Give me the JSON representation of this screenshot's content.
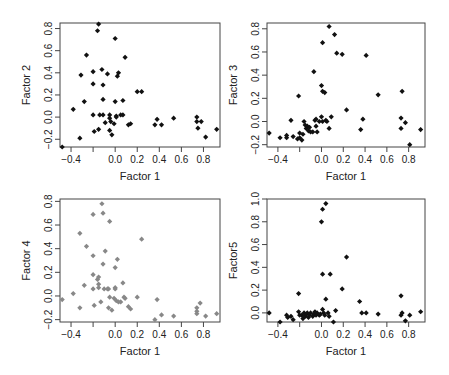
{
  "figure": {
    "layout": "2x2 scatter matrix",
    "point_colors": {
      "default": "#111111",
      "factor4": "#888888"
    }
  },
  "chart_data": [
    {
      "type": "scatter",
      "title": "",
      "xlabel": "Factor 1",
      "ylabel": "Factor 2",
      "xlim": [
        -0.5,
        0.95
      ],
      "ylim": [
        -0.27,
        0.85
      ],
      "xticks": [
        -0.4,
        -0.2,
        0.0,
        0.2,
        0.4,
        0.6,
        0.8
      ],
      "xtick_labels": [
        "-0.4",
        "",
        "0.0",
        "0.2",
        "0.4",
        "0.6",
        "0.8"
      ],
      "yticks": [
        -0.2,
        0.0,
        0.2,
        0.4,
        0.6,
        0.8
      ],
      "ytick_labels": [
        "-0.2",
        "0.0",
        "0.2",
        "0.4",
        "0.6",
        "0.8"
      ],
      "color": "#111111",
      "points": [
        [
          -0.48,
          -0.27
        ],
        [
          -0.38,
          0.07
        ],
        [
          -0.32,
          -0.19
        ],
        [
          -0.31,
          0.38
        ],
        [
          -0.28,
          0.14
        ],
        [
          -0.26,
          0.56
        ],
        [
          -0.2,
          0.41
        ],
        [
          -0.2,
          0.3
        ],
        [
          -0.2,
          0.02
        ],
        [
          -0.19,
          -0.13
        ],
        [
          -0.16,
          0.78
        ],
        [
          -0.15,
          0.84
        ],
        [
          -0.15,
          -0.11
        ],
        [
          -0.14,
          0.02
        ],
        [
          -0.12,
          0.43
        ],
        [
          -0.11,
          0.29
        ],
        [
          -0.11,
          0.16
        ],
        [
          -0.11,
          0.02
        ],
        [
          -0.09,
          -0.05
        ],
        [
          -0.07,
          0.39
        ],
        [
          -0.05,
          0.02
        ],
        [
          -0.05,
          -0.01
        ],
        [
          -0.05,
          -0.12
        ],
        [
          -0.04,
          -0.04
        ],
        [
          -0.03,
          -0.16
        ],
        [
          -0.01,
          -0.06
        ],
        [
          0.0,
          0.14
        ],
        [
          0.0,
          0.71
        ],
        [
          0.01,
          0.01
        ],
        [
          0.01,
          0.0
        ],
        [
          0.02,
          0.37
        ],
        [
          0.03,
          0.4
        ],
        [
          0.05,
          0.02
        ],
        [
          0.07,
          0.15
        ],
        [
          0.07,
          0.02
        ],
        [
          0.09,
          0.54
        ],
        [
          0.12,
          -0.07
        ],
        [
          0.14,
          -0.06
        ],
        [
          0.2,
          0.23
        ],
        [
          0.24,
          0.23
        ],
        [
          0.36,
          -0.07
        ],
        [
          0.38,
          -0.02
        ],
        [
          0.42,
          -0.07
        ],
        [
          0.53,
          -0.01
        ],
        [
          0.74,
          0.0
        ],
        [
          0.74,
          -0.04
        ],
        [
          0.75,
          -0.1
        ],
        [
          0.78,
          -0.04
        ],
        [
          0.82,
          -0.18
        ],
        [
          0.92,
          -0.11
        ]
      ]
    },
    {
      "type": "scatter",
      "title": "",
      "xlabel": "Factor 1",
      "ylabel": "Factor 3",
      "xlim": [
        -0.5,
        0.95
      ],
      "ylim": [
        -0.22,
        0.85
      ],
      "xticks": [
        -0.4,
        -0.2,
        0.0,
        0.2,
        0.4,
        0.6,
        0.8
      ],
      "xtick_labels": [
        "-0.4",
        "",
        "0.0",
        "0.2",
        "0.4",
        "0.6",
        "0.8"
      ],
      "yticks": [
        -0.2,
        0.0,
        0.2,
        0.4,
        0.6,
        0.8
      ],
      "ytick_labels": [
        "-0.2",
        "0.0",
        "0.2",
        "0.4",
        "0.6",
        "0.8"
      ],
      "color": "#111111",
      "points": [
        [
          -0.48,
          -0.1
        ],
        [
          -0.38,
          -0.14
        ],
        [
          -0.32,
          -0.14
        ],
        [
          -0.32,
          -0.12
        ],
        [
          -0.28,
          0.01
        ],
        [
          -0.26,
          -0.13
        ],
        [
          -0.22,
          -0.15
        ],
        [
          -0.21,
          0.22
        ],
        [
          -0.2,
          -0.1
        ],
        [
          -0.2,
          -0.14
        ],
        [
          -0.18,
          -0.16
        ],
        [
          -0.17,
          -0.11
        ],
        [
          -0.16,
          0.0
        ],
        [
          -0.15,
          -0.03
        ],
        [
          -0.14,
          -0.06
        ],
        [
          -0.13,
          -0.04
        ],
        [
          -0.12,
          -0.08
        ],
        [
          -0.11,
          -0.05
        ],
        [
          -0.1,
          -0.09
        ],
        [
          -0.08,
          -0.09
        ],
        [
          -0.07,
          0.43
        ],
        [
          -0.06,
          0.01
        ],
        [
          -0.05,
          -0.04
        ],
        [
          -0.05,
          0.02
        ],
        [
          -0.04,
          -0.09
        ],
        [
          -0.02,
          0.0
        ],
        [
          0.0,
          0.31
        ],
        [
          0.0,
          0.04
        ],
        [
          0.01,
          0.26
        ],
        [
          0.01,
          0.0
        ],
        [
          0.01,
          0.68
        ],
        [
          0.03,
          0.25
        ],
        [
          0.04,
          0.01
        ],
        [
          0.05,
          0.0
        ],
        [
          0.07,
          -0.06
        ],
        [
          0.07,
          0.82
        ],
        [
          0.09,
          0.04
        ],
        [
          0.12,
          0.75
        ],
        [
          0.14,
          0.59
        ],
        [
          0.19,
          0.58
        ],
        [
          0.23,
          0.1
        ],
        [
          0.36,
          -0.07
        ],
        [
          0.38,
          0.02
        ],
        [
          0.41,
          0.57
        ],
        [
          0.52,
          0.23
        ],
        [
          0.73,
          -0.06
        ],
        [
          0.73,
          0.03
        ],
        [
          0.74,
          0.26
        ],
        [
          0.77,
          -0.01
        ],
        [
          0.81,
          -0.2
        ],
        [
          0.91,
          -0.07
        ]
      ]
    },
    {
      "type": "scatter",
      "title": "",
      "xlabel": "Factor 1",
      "ylabel": "Factor 4",
      "xlim": [
        -0.5,
        0.95
      ],
      "ylim": [
        -0.22,
        0.82
      ],
      "xticks": [
        -0.4,
        -0.2,
        0.0,
        0.2,
        0.4,
        0.6,
        0.8
      ],
      "xtick_labels": [
        "-0.4",
        "",
        "0.0",
        "0.2",
        "0.4",
        "0.6",
        "0.8"
      ],
      "yticks": [
        -0.2,
        0.0,
        0.2,
        0.4,
        0.6,
        0.8
      ],
      "ytick_labels": [
        "-0.2",
        "0.0",
        "0.2",
        "0.4",
        "0.6",
        "0.8"
      ],
      "color": "#888888",
      "points": [
        [
          -0.48,
          -0.03
        ],
        [
          -0.38,
          0.02
        ],
        [
          -0.32,
          0.53
        ],
        [
          -0.32,
          -0.1
        ],
        [
          -0.28,
          0.09
        ],
        [
          -0.26,
          0.42
        ],
        [
          -0.2,
          0.34
        ],
        [
          -0.2,
          0.18
        ],
        [
          -0.2,
          0.06
        ],
        [
          -0.2,
          0.69
        ],
        [
          -0.19,
          -0.08
        ],
        [
          -0.16,
          0.14
        ],
        [
          -0.15,
          0.16
        ],
        [
          -0.15,
          0.1
        ],
        [
          -0.15,
          0.07
        ],
        [
          -0.13,
          -0.05
        ],
        [
          -0.12,
          0.78
        ],
        [
          -0.11,
          0.27
        ],
        [
          -0.11,
          0.7
        ],
        [
          -0.1,
          0.06
        ],
        [
          -0.09,
          0.38
        ],
        [
          -0.07,
          0.06
        ],
        [
          -0.06,
          0.06
        ],
        [
          -0.06,
          -0.1
        ],
        [
          -0.05,
          -0.01
        ],
        [
          -0.05,
          0.63
        ],
        [
          -0.03,
          -0.12
        ],
        [
          -0.01,
          -0.02
        ],
        [
          0.0,
          0.24
        ],
        [
          0.0,
          0.07
        ],
        [
          0.0,
          0.06
        ],
        [
          0.01,
          -0.04
        ],
        [
          0.02,
          0.31
        ],
        [
          0.03,
          -0.05
        ],
        [
          0.05,
          -0.05
        ],
        [
          0.07,
          0.11
        ],
        [
          0.08,
          -0.01
        ],
        [
          0.09,
          -0.02
        ],
        [
          0.12,
          -0.09
        ],
        [
          0.14,
          -0.11
        ],
        [
          0.2,
          -0.01
        ],
        [
          0.24,
          0.48
        ],
        [
          0.36,
          -0.2
        ],
        [
          0.38,
          -0.03
        ],
        [
          0.42,
          -0.16
        ],
        [
          0.53,
          -0.17
        ],
        [
          0.74,
          -0.1
        ],
        [
          0.74,
          -0.13
        ],
        [
          0.74,
          -0.15
        ],
        [
          0.77,
          -0.06
        ],
        [
          0.82,
          -0.17
        ],
        [
          0.92,
          -0.15
        ]
      ]
    },
    {
      "type": "scatter",
      "title": "",
      "xlabel": "Factor 1",
      "ylabel": "Factor5",
      "xlim": [
        -0.5,
        0.95
      ],
      "ylim": [
        -0.08,
        1.0
      ],
      "xticks": [
        -0.4,
        -0.2,
        0.0,
        0.2,
        0.4,
        0.6,
        0.8
      ],
      "xtick_labels": [
        "-0.4",
        "",
        "0.0",
        "0.2",
        "0.4",
        "0.6",
        "0.8"
      ],
      "yticks": [
        0.0,
        0.2,
        0.4,
        0.6,
        0.8,
        1.0
      ],
      "ytick_labels": [
        "0.0",
        "0.2",
        "0.4",
        "0.6",
        "0.8",
        "1.0"
      ],
      "color": "#111111",
      "points": [
        [
          -0.48,
          0.0
        ],
        [
          -0.38,
          -0.08
        ],
        [
          -0.32,
          -0.02
        ],
        [
          -0.31,
          -0.04
        ],
        [
          -0.28,
          -0.03
        ],
        [
          -0.26,
          -0.06
        ],
        [
          -0.21,
          0.17
        ],
        [
          -0.21,
          0.01
        ],
        [
          -0.2,
          -0.02
        ],
        [
          -0.18,
          -0.02
        ],
        [
          -0.17,
          -0.05
        ],
        [
          -0.16,
          0.0
        ],
        [
          -0.15,
          -0.03
        ],
        [
          -0.14,
          -0.01
        ],
        [
          -0.13,
          0.0
        ],
        [
          -0.12,
          -0.04
        ],
        [
          -0.11,
          -0.02
        ],
        [
          -0.1,
          0.0
        ],
        [
          -0.08,
          -0.03
        ],
        [
          -0.07,
          -0.01
        ],
        [
          -0.06,
          0.01
        ],
        [
          -0.05,
          -0.02
        ],
        [
          -0.04,
          0.0
        ],
        [
          -0.02,
          -0.02
        ],
        [
          -0.01,
          -0.01
        ],
        [
          0.0,
          0.8
        ],
        [
          0.01,
          0.91
        ],
        [
          0.01,
          0.34
        ],
        [
          0.01,
          0.03
        ],
        [
          0.02,
          0.0
        ],
        [
          0.03,
          -0.02
        ],
        [
          0.04,
          0.96
        ],
        [
          0.04,
          0.12
        ],
        [
          0.06,
          0.0
        ],
        [
          0.07,
          -0.03
        ],
        [
          0.08,
          0.34
        ],
        [
          0.11,
          -0.08
        ],
        [
          0.13,
          0.02
        ],
        [
          0.19,
          0.21
        ],
        [
          0.23,
          0.49
        ],
        [
          0.35,
          0.1
        ],
        [
          0.37,
          0.0
        ],
        [
          0.41,
          0.0
        ],
        [
          0.52,
          -0.01
        ],
        [
          0.73,
          0.15
        ],
        [
          0.73,
          -0.02
        ],
        [
          0.74,
          0.0
        ],
        [
          0.77,
          -0.07
        ],
        [
          0.81,
          -0.02
        ],
        [
          0.91,
          0.01
        ]
      ]
    }
  ]
}
